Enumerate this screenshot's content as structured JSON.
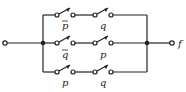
{
  "diagram": {
    "type": "switching-circuit",
    "output_label": "f",
    "branches": [
      {
        "switches": [
          "p̄",
          "q"
        ],
        "overbar": [
          true,
          false
        ]
      },
      {
        "switches": [
          "q̄",
          "p"
        ],
        "overbar": [
          true,
          false
        ]
      },
      {
        "switches": [
          "p",
          "q"
        ],
        "overbar": [
          false,
          false
        ]
      }
    ],
    "labels": {
      "b0s0": "p",
      "b0s1": "q",
      "b1s0": "q",
      "b1s1": "p",
      "b2s0": "p",
      "b2s1": "q",
      "out": "f"
    },
    "line_color": "#222222"
  }
}
